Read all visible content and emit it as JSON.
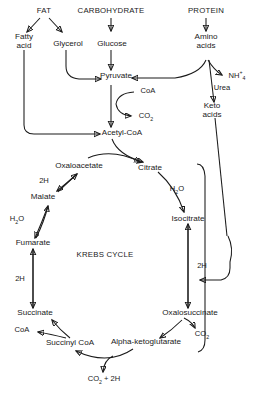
{
  "diagram": {
    "center_label": "KREBS CYCLE",
    "background_color": "#ffffff",
    "stroke_color": "#1a1a1a",
    "sources": {
      "fat": "FAT",
      "carbohydrate": "CARBOHYDRATE",
      "protein": "PROTEIN"
    },
    "nodes": {
      "fatty_acid": "Fatty\nacid",
      "glycerol": "Glycerol",
      "glucose": "Glucose",
      "amino_acids": "Amino\nacids",
      "pyruvate": "Pyruvate",
      "acetyl_coa": "Acetyl-CoA",
      "keto_acids": "Keto\nacids",
      "urea": "Urea",
      "oxaloacetate": "Oxaloacetate",
      "citrate": "Citrate",
      "isocitrate": "Isocitrate",
      "oxalosuccinate": "Oxalosuccinate",
      "alpha_ketoglutarate": "Alpha-ketoglutarate",
      "succinyl_coa": "Succinyl CoA",
      "succinate": "Succinate",
      "fumarate": "Fumarate",
      "malate": "Malate"
    },
    "cofactors": {
      "coa_pyruvate": "CoA",
      "coa_succinate": "CoA",
      "co2_pyruvate": "CO2",
      "co2_oxalosuccinate": "CO2",
      "co2_2h_bottom": "CO2 + 2H",
      "h2o_citrate": "H2O",
      "h2o_fumarate": "H2O",
      "ammonium": "NH4+",
      "h2_malate": "2H",
      "h2_succinate": "2H",
      "h2_isocitrate": "2H"
    },
    "formula_parts": {
      "co2_base": "CO",
      "co2_sub": "2",
      "h2o_h": "H",
      "h2o_sub": "2",
      "h2o_o": "O",
      "nh_base": "NH",
      "nh_sup": "+",
      "nh_sub": "4",
      "co2_plus_2h_tail": " + 2H"
    }
  }
}
